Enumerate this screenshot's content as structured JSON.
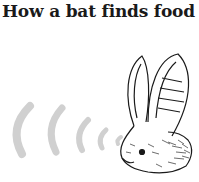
{
  "title": "How a bat finds food",
  "illustration": {
    "subject": "long-eared bat head",
    "sound_waves": 5,
    "colors": {
      "waves": "#d0d0d0",
      "ink": "#1a1a1a",
      "background": "#ffffff"
    }
  }
}
